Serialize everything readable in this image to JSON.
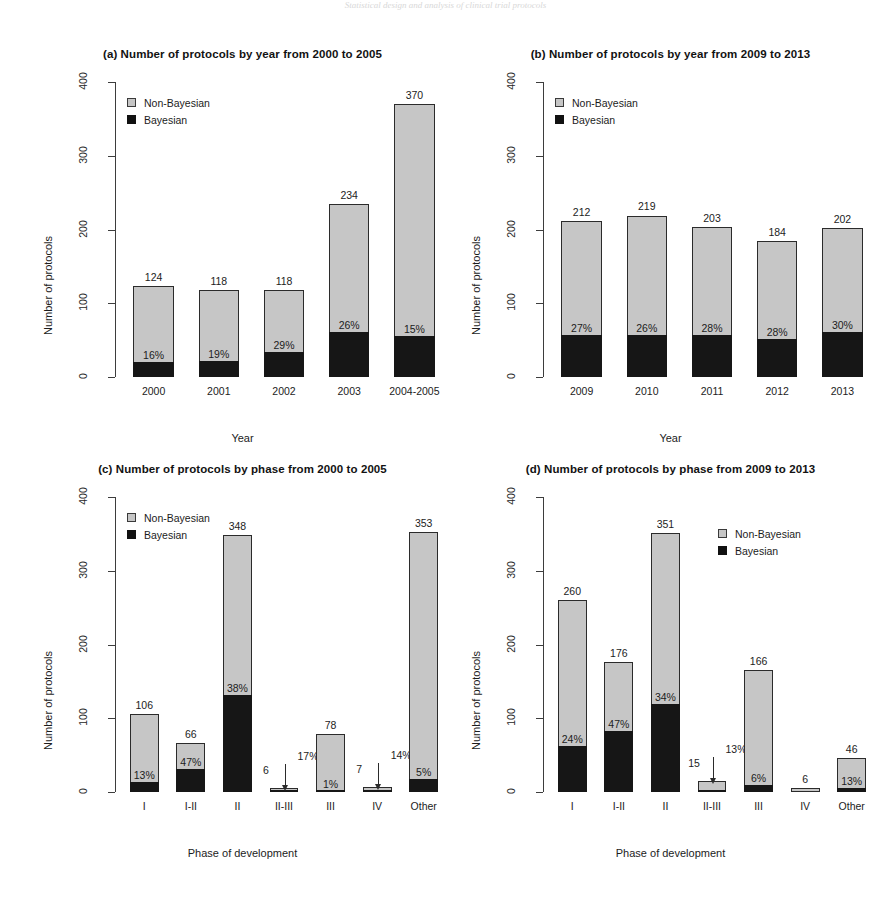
{
  "figure": {
    "header_faint": "Statistical design and analysis of clinical trial protocols",
    "legend": {
      "non_bayesian": "Non-Bayesian",
      "bayesian": "Bayesian"
    },
    "colors": {
      "non_bayesian": "#c6c6c6",
      "bayesian": "#161616",
      "axis": "#3d3d3d",
      "text": "#1c1c1c"
    }
  },
  "chart_data": [
    {
      "id": "a",
      "type": "bar",
      "stacked": true,
      "title": "(a) Number of protocols by year from 2000 to 2005",
      "xlabel": "Year",
      "ylabel": "Number of protocols",
      "ylim": [
        0,
        400
      ],
      "yticks": [
        0,
        100,
        200,
        300,
        400
      ],
      "grid": false,
      "legend_position": "top-left",
      "categories": [
        "2000",
        "2001",
        "2002",
        "2003",
        "2004-2005"
      ],
      "totals": [
        124,
        118,
        118,
        234,
        370
      ],
      "bayesian_pct": [
        16,
        19,
        29,
        26,
        15
      ],
      "pct_labels": [
        "16%",
        "19%",
        "29%",
        "26%",
        "15%"
      ],
      "total_labels": [
        "124",
        "118",
        "118",
        "234",
        "370"
      ],
      "series": [
        {
          "name": "Bayesian",
          "values": [
            20,
            22,
            34,
            61,
            56
          ]
        },
        {
          "name": "Non-Bayesian",
          "values": [
            104,
            96,
            84,
            173,
            314
          ]
        }
      ]
    },
    {
      "id": "b",
      "type": "bar",
      "stacked": true,
      "title": "(b) Number of protocols by year from 2009 to 2013",
      "xlabel": "Year",
      "ylabel": "Number of protocols",
      "ylim": [
        0,
        400
      ],
      "yticks": [
        0,
        100,
        200,
        300,
        400
      ],
      "grid": false,
      "legend_position": "top-left",
      "categories": [
        "2009",
        "2010",
        "2011",
        "2012",
        "2013"
      ],
      "totals": [
        212,
        219,
        203,
        184,
        202
      ],
      "bayesian_pct": [
        27,
        26,
        28,
        28,
        30
      ],
      "pct_labels": [
        "27%",
        "26%",
        "28%",
        "28%",
        "30%"
      ],
      "total_labels": [
        "212",
        "219",
        "203",
        "184",
        "202"
      ],
      "series": [
        {
          "name": "Bayesian",
          "values": [
            57,
            57,
            57,
            52,
            61
          ]
        },
        {
          "name": "Non-Bayesian",
          "values": [
            155,
            162,
            146,
            132,
            141
          ]
        }
      ]
    },
    {
      "id": "c",
      "type": "bar",
      "stacked": true,
      "title": "(c) Number of protocols by phase from 2000 to 2005",
      "xlabel": "Phase of development",
      "ylabel": "Number of protocols",
      "ylim": [
        0,
        400
      ],
      "yticks": [
        0,
        100,
        200,
        300,
        400
      ],
      "grid": false,
      "legend_position": "top-left",
      "categories": [
        "I",
        "I-II",
        "II",
        "II-III",
        "III",
        "IV",
        "Other"
      ],
      "totals": [
        106,
        66,
        348,
        6,
        78,
        7,
        353
      ],
      "bayesian_pct": [
        13,
        47,
        38,
        17,
        1,
        14,
        5
      ],
      "pct_labels": [
        "13%",
        "47%",
        "38%",
        "17%",
        "1%",
        "14%",
        "5%"
      ],
      "total_labels": [
        "106",
        "66",
        "348",
        "6",
        "78",
        "7",
        "353"
      ],
      "callouts": [
        {
          "category": "II-III",
          "number": "6",
          "pct": "17%"
        },
        {
          "category": "IV",
          "number": "7",
          "pct": "14%"
        }
      ],
      "series": [
        {
          "name": "Bayesian",
          "values": [
            14,
            31,
            132,
            1,
            1,
            1,
            18
          ]
        },
        {
          "name": "Non-Bayesian",
          "values": [
            92,
            35,
            216,
            5,
            77,
            6,
            335
          ]
        }
      ]
    },
    {
      "id": "d",
      "type": "bar",
      "stacked": true,
      "title": "(d) Number of protocols by phase from 2009 to 2013",
      "xlabel": "Phase of development",
      "ylabel": "Number of protocols",
      "ylim": [
        0,
        400
      ],
      "yticks": [
        0,
        100,
        200,
        300,
        400
      ],
      "grid": false,
      "legend_position": "top-right",
      "categories": [
        "I",
        "I-II",
        "II",
        "II-III",
        "III",
        "IV",
        "Other"
      ],
      "totals": [
        260,
        176,
        351,
        15,
        166,
        6,
        46
      ],
      "bayesian_pct": [
        24,
        47,
        34,
        13,
        6,
        null,
        13
      ],
      "pct_labels": [
        "24%",
        "47%",
        "34%",
        "13%",
        "6%",
        "",
        "13%"
      ],
      "total_labels": [
        "260",
        "176",
        "351",
        "15",
        "166",
        "6",
        "46"
      ],
      "callouts": [
        {
          "category": "II-III",
          "number": "15",
          "pct": "13%"
        }
      ],
      "series": [
        {
          "name": "Bayesian",
          "values": [
            62,
            83,
            119,
            2,
            10,
            0,
            6
          ]
        },
        {
          "name": "Non-Bayesian",
          "values": [
            198,
            93,
            232,
            13,
            156,
            6,
            40
          ]
        }
      ]
    }
  ]
}
